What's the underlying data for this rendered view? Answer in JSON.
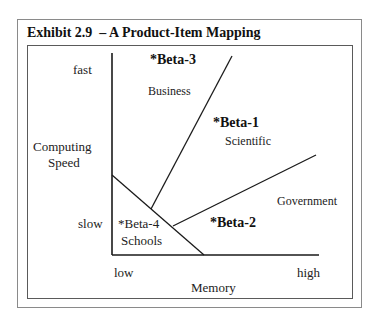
{
  "exhibit": {
    "title": "Exhibit 2.9  – A Product-Item Mapping"
  },
  "axes": {
    "y_label_line1": "Computing",
    "y_label_line2": "Speed",
    "y_high": "fast",
    "y_low": "slow",
    "x_label": "Memory",
    "x_low": "low",
    "x_high": "high"
  },
  "regions": [
    {
      "product": "*Beta-3",
      "segment": "Business"
    },
    {
      "product": "*Beta-1",
      "segment": "Scientific"
    },
    {
      "product": "*Beta-2",
      "segment": "Government"
    },
    {
      "product": "*Beta-4",
      "segment": "Schools"
    }
  ],
  "colors": {
    "line": "#1a1a1a",
    "border": "#8a8a8a"
  }
}
